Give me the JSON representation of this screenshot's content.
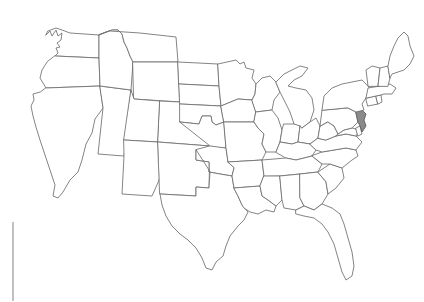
{
  "figure": {
    "kind": "choropleth-outline-map",
    "title": "Map of the United States",
    "background_color": "#ffffff",
    "width": 424,
    "height": 302
  },
  "map": {
    "projection_note": "contiguous United States, state boundaries only",
    "default_state_fill": "#ffffff",
    "state_border_color": "#6e6e6e",
    "highlight_fill": "#8a8a8a",
    "highlight_border_color": "#5a5a5a",
    "highlighted_states": [
      "New Jersey"
    ],
    "labels_visible": false,
    "legend_visible": false,
    "title_visible": false
  },
  "decorations": {
    "left_rule": {
      "name": "left-margin-rule",
      "color": "#8d8d8d",
      "x": 13,
      "y_start": 222,
      "y_end": 301
    }
  },
  "states": [
    {
      "name": "Washington",
      "abbr": "WA",
      "highlighted": false
    },
    {
      "name": "Oregon",
      "abbr": "OR",
      "highlighted": false
    },
    {
      "name": "California",
      "abbr": "CA",
      "highlighted": false
    },
    {
      "name": "Nevada",
      "abbr": "NV",
      "highlighted": false
    },
    {
      "name": "Idaho",
      "abbr": "ID",
      "highlighted": false
    },
    {
      "name": "Montana",
      "abbr": "MT",
      "highlighted": false
    },
    {
      "name": "Wyoming",
      "abbr": "WY",
      "highlighted": false
    },
    {
      "name": "Utah",
      "abbr": "UT",
      "highlighted": false
    },
    {
      "name": "Arizona",
      "abbr": "AZ",
      "highlighted": false
    },
    {
      "name": "Colorado",
      "abbr": "CO",
      "highlighted": false
    },
    {
      "name": "New Mexico",
      "abbr": "NM",
      "highlighted": false
    },
    {
      "name": "North Dakota",
      "abbr": "ND",
      "highlighted": false
    },
    {
      "name": "South Dakota",
      "abbr": "SD",
      "highlighted": false
    },
    {
      "name": "Nebraska",
      "abbr": "NE",
      "highlighted": false
    },
    {
      "name": "Kansas",
      "abbr": "KS",
      "highlighted": false
    },
    {
      "name": "Oklahoma",
      "abbr": "OK",
      "highlighted": false
    },
    {
      "name": "Texas",
      "abbr": "TX",
      "highlighted": false
    },
    {
      "name": "Minnesota",
      "abbr": "MN",
      "highlighted": false
    },
    {
      "name": "Iowa",
      "abbr": "IA",
      "highlighted": false
    },
    {
      "name": "Missouri",
      "abbr": "MO",
      "highlighted": false
    },
    {
      "name": "Arkansas",
      "abbr": "AR",
      "highlighted": false
    },
    {
      "name": "Louisiana",
      "abbr": "LA",
      "highlighted": false
    },
    {
      "name": "Wisconsin",
      "abbr": "WI",
      "highlighted": false
    },
    {
      "name": "Illinois",
      "abbr": "IL",
      "highlighted": false
    },
    {
      "name": "Michigan",
      "abbr": "MI",
      "highlighted": false
    },
    {
      "name": "Indiana",
      "abbr": "IN",
      "highlighted": false
    },
    {
      "name": "Ohio",
      "abbr": "OH",
      "highlighted": false
    },
    {
      "name": "Kentucky",
      "abbr": "KY",
      "highlighted": false
    },
    {
      "name": "Tennessee",
      "abbr": "TN",
      "highlighted": false
    },
    {
      "name": "Mississippi",
      "abbr": "MS",
      "highlighted": false
    },
    {
      "name": "Alabama",
      "abbr": "AL",
      "highlighted": false
    },
    {
      "name": "Georgia",
      "abbr": "GA",
      "highlighted": false
    },
    {
      "name": "Florida",
      "abbr": "FL",
      "highlighted": false
    },
    {
      "name": "South Carolina",
      "abbr": "SC",
      "highlighted": false
    },
    {
      "name": "North Carolina",
      "abbr": "NC",
      "highlighted": false
    },
    {
      "name": "Virginia",
      "abbr": "VA",
      "highlighted": false
    },
    {
      "name": "West Virginia",
      "abbr": "WV",
      "highlighted": false
    },
    {
      "name": "Maryland",
      "abbr": "MD",
      "highlighted": false
    },
    {
      "name": "Delaware",
      "abbr": "DE",
      "highlighted": false
    },
    {
      "name": "Pennsylvania",
      "abbr": "PA",
      "highlighted": false
    },
    {
      "name": "New Jersey",
      "abbr": "NJ",
      "highlighted": true
    },
    {
      "name": "New York",
      "abbr": "NY",
      "highlighted": false
    },
    {
      "name": "Connecticut",
      "abbr": "CT",
      "highlighted": false
    },
    {
      "name": "Rhode Island",
      "abbr": "RI",
      "highlighted": false
    },
    {
      "name": "Massachusetts",
      "abbr": "MA",
      "highlighted": false
    },
    {
      "name": "Vermont",
      "abbr": "VT",
      "highlighted": false
    },
    {
      "name": "New Hampshire",
      "abbr": "NH",
      "highlighted": false
    },
    {
      "name": "Maine",
      "abbr": "ME",
      "highlighted": false
    }
  ]
}
